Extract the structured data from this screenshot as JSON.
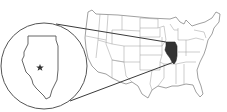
{
  "map": {
    "kind": "locator-map",
    "subject_region": "Illinois",
    "context_region": "United States",
    "highlight_color": "#333333",
    "outline_color": "#555555",
    "background_color": "#ffffff",
    "inset": {
      "shape": "circle",
      "marker": "star",
      "marker_label": ""
    }
  }
}
